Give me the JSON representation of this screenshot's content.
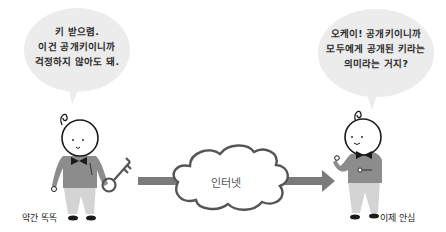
{
  "left_person": {
    "speech_lines": [
      "키 받으렴.",
      "이건 공개키이니까",
      "걱정하지 않아도 돼."
    ],
    "caption": "약간 똑똑",
    "holds": "key-icon"
  },
  "right_person": {
    "speech_lines": [
      "오케이! 공개키이니까",
      "모두에게 공개된 키라는",
      "의미라는 거지?"
    ],
    "caption": "이제 안심"
  },
  "network": {
    "label": "인터넷"
  },
  "colors": {
    "bubble_fill": "#ececec",
    "sweater": "#8c8c8c",
    "pants": "#d4d4d4",
    "outline": "#1a1a1a",
    "arrow": "#7a7a7a",
    "cloud_stroke": "#555555"
  }
}
